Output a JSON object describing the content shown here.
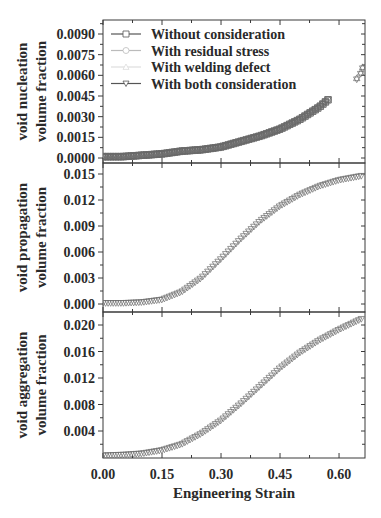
{
  "chart_data": [
    {
      "type": "scatter",
      "panel": "top",
      "title": "",
      "ylabel": [
        "void nucleation",
        "volume fraction"
      ],
      "xlabel": "Engineering Strain",
      "xlim": [
        0.0,
        0.666
      ],
      "ylim": [
        -0.0003,
        0.0101
      ],
      "yticks": [
        "0.0090",
        "0.0075",
        "0.0060",
        "0.0045",
        "0.0030",
        "0.0015",
        "0.0000"
      ],
      "ytick_values": [
        0.009,
        0.0075,
        0.006,
        0.0045,
        0.003,
        0.0015,
        0.0
      ],
      "legend_position": "upper left",
      "series": [
        {
          "name": "Without consideration",
          "marker": "square",
          "x": [
            0.0,
            0.05,
            0.1,
            0.15,
            0.2,
            0.25,
            0.3,
            0.35,
            0.4,
            0.45,
            0.5,
            0.55,
            0.575
          ],
          "values": [
            0.0001,
            0.0001,
            0.0002,
            0.0003,
            0.0005,
            0.0006,
            0.0008,
            0.0012,
            0.0016,
            0.0021,
            0.0028,
            0.0037,
            0.0043
          ]
        },
        {
          "name": "With residual stress",
          "marker": "circle",
          "x": [
            0.0,
            0.05,
            0.1,
            0.15,
            0.2,
            0.25,
            0.3,
            0.35,
            0.4,
            0.45,
            0.5,
            0.55,
            0.575
          ],
          "values": [
            0.0001,
            0.0001,
            0.0002,
            0.0003,
            0.0005,
            0.0006,
            0.0008,
            0.0012,
            0.0016,
            0.0021,
            0.0028,
            0.0037,
            0.0043
          ]
        },
        {
          "name": "With welding defect",
          "marker": "triangle-up",
          "x": [
            0.0,
            0.05,
            0.1,
            0.15,
            0.2,
            0.25,
            0.3,
            0.35,
            0.4,
            0.45,
            0.5,
            0.55,
            0.575,
            0.645,
            0.655,
            0.66
          ],
          "values": [
            0.0001,
            0.0001,
            0.0002,
            0.0003,
            0.0005,
            0.0006,
            0.0008,
            0.0012,
            0.0016,
            0.0021,
            0.0028,
            0.0037,
            0.0043,
            0.0058,
            0.0062,
            0.0066
          ]
        },
        {
          "name": "With both consideration",
          "marker": "triangle-down",
          "x": [
            0.0,
            0.05,
            0.1,
            0.15,
            0.2,
            0.25,
            0.3,
            0.35,
            0.4,
            0.45,
            0.5,
            0.55,
            0.575,
            0.645,
            0.655,
            0.66
          ],
          "values": [
            0.0001,
            0.0001,
            0.0002,
            0.0003,
            0.0005,
            0.0006,
            0.0008,
            0.0012,
            0.0016,
            0.0021,
            0.0028,
            0.0037,
            0.0043,
            0.0057,
            0.0061,
            0.0065
          ]
        }
      ]
    },
    {
      "type": "scatter",
      "panel": "middle",
      "ylabel": [
        "void propagation",
        "volume fraction"
      ],
      "xlim": [
        0.0,
        0.666
      ],
      "ylim": [
        -0.0005,
        0.0165
      ],
      "yticks": [
        "0.015",
        "0.012",
        "0.009",
        "0.006",
        "0.003",
        "0.000"
      ],
      "ytick_values": [
        0.015,
        0.012,
        0.009,
        0.006,
        0.003,
        0.0
      ],
      "series": [
        {
          "name": "All cases (overlapping)",
          "marker": "triangle/square/circle",
          "x": [
            0.0,
            0.05,
            0.1,
            0.15,
            0.2,
            0.25,
            0.3,
            0.35,
            0.4,
            0.45,
            0.5,
            0.55,
            0.6,
            0.66
          ],
          "values": [
            0.0001,
            0.0001,
            0.0002,
            0.0005,
            0.0014,
            0.003,
            0.0052,
            0.0075,
            0.0096,
            0.0113,
            0.0126,
            0.0136,
            0.0143,
            0.0148
          ]
        }
      ]
    },
    {
      "type": "scatter",
      "panel": "bottom",
      "ylabel": [
        "void aggregation",
        "volume fraction"
      ],
      "xlim": [
        0.0,
        0.666
      ],
      "ylim": [
        0.0,
        0.022
      ],
      "yticks": [
        "0.020",
        "0.016",
        "0.012",
        "0.008",
        "0.004"
      ],
      "ytick_values": [
        0.02,
        0.016,
        0.012,
        0.008,
        0.004
      ],
      "xticks": [
        "0.00",
        "0.15",
        "0.30",
        "0.45",
        "0.60"
      ],
      "xtick_values": [
        0.0,
        0.15,
        0.3,
        0.45,
        0.6
      ],
      "series": [
        {
          "name": "All cases (overlapping)",
          "marker": "triangle/square/circle",
          "x": [
            0.0,
            0.05,
            0.1,
            0.15,
            0.2,
            0.25,
            0.3,
            0.35,
            0.4,
            0.45,
            0.5,
            0.55,
            0.6,
            0.66
          ],
          "values": [
            0.0003,
            0.0004,
            0.0006,
            0.0011,
            0.002,
            0.0036,
            0.0056,
            0.0081,
            0.0108,
            0.0135,
            0.0158,
            0.0177,
            0.0193,
            0.021
          ]
        }
      ]
    }
  ],
  "figure": {
    "xlabel": "Engineering Strain",
    "legend": [
      {
        "label": "Without consideration",
        "marker": "square"
      },
      {
        "label": "With residual stress",
        "marker": "circle"
      },
      {
        "label": "With welding defect",
        "marker": "triangle-up"
      },
      {
        "label": "With both consideration",
        "marker": "triangle-down"
      }
    ],
    "colors": {
      "axis": "#3a3a3a",
      "marker": "#6a6a6a",
      "legend_line_dark": "#555555",
      "legend_line_light": "#bbbbbb"
    }
  }
}
